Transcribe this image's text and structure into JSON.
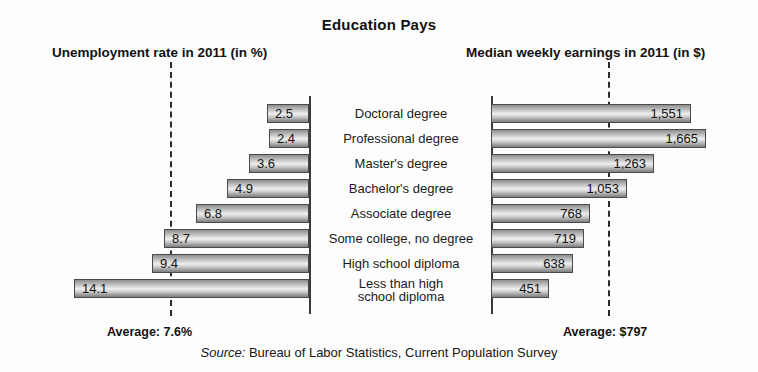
{
  "title": "Education Pays",
  "columns": {
    "left_header": "Unemployment rate in 2011 (in %)",
    "right_header": "Median weekly earnings in 2011 (in $)"
  },
  "footer": {
    "left_average": "Average: 7.6%",
    "right_average": "Average: $797",
    "source_word": "Source:",
    "source_text": " Bureau of Labor Statistics, Current Population Survey"
  },
  "rows": [
    {
      "label": "Doctoral degree",
      "label_line2": "",
      "unemployment": "2.5",
      "earnings": "1,551"
    },
    {
      "label": "Professional degree",
      "label_line2": "",
      "unemployment": "2.4",
      "earnings": "1,665"
    },
    {
      "label": "Master's degree",
      "label_line2": "",
      "unemployment": "3.6",
      "earnings": "1,263"
    },
    {
      "label": "Bachelor's degree",
      "label_line2": "",
      "unemployment": "4.9",
      "earnings": "1,053"
    },
    {
      "label": "Associate degree",
      "label_line2": "",
      "unemployment": "6.8",
      "earnings": "768"
    },
    {
      "label": "Some college, no degree",
      "label_line2": "",
      "unemployment": "8.7",
      "earnings": "719"
    },
    {
      "label": "High school diploma",
      "label_line2": "",
      "unemployment": "9.4",
      "earnings": "638"
    },
    {
      "label": "Less than high",
      "label_line2": "school diploma",
      "unemployment": "14.1",
      "earnings": "451"
    }
  ],
  "chart_data": {
    "type": "bar",
    "title": "Education Pays",
    "orientation": "horizontal-bidirectional",
    "categories": [
      "Doctoral degree",
      "Professional degree",
      "Master's degree",
      "Bachelor's degree",
      "Associate degree",
      "Some college, no degree",
      "High school diploma",
      "Less than high school diploma"
    ],
    "series": [
      {
        "name": "Unemployment rate in 2011 (in %)",
        "unit": "%",
        "direction": "left",
        "values": [
          2.5,
          2.4,
          3.6,
          4.9,
          6.8,
          8.7,
          9.4,
          14.1
        ],
        "axis_max": 16,
        "reference_line": {
          "label": "Average: 7.6%",
          "value": 7.6
        }
      },
      {
        "name": "Median weekly earnings in 2011 (in $)",
        "unit": "$",
        "direction": "right",
        "values": [
          1551,
          1665,
          1263,
          1053,
          768,
          719,
          638,
          451
        ],
        "axis_max": 1850,
        "reference_line": {
          "label": "Average: $797",
          "value": 797
        }
      }
    ],
    "xlabel": "",
    "ylabel": "",
    "grid": false,
    "legend": "none",
    "annotations": [
      "Source: Bureau of Labor Statistics, Current Population Survey"
    ]
  }
}
